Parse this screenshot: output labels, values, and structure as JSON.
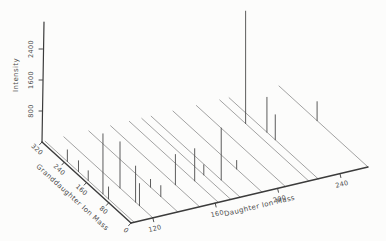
{
  "chart_data": {
    "type": "scatter",
    "variant": "3d oblique stem plot (tandem mass spectrometry map, intensity vs daughter/granddaughter ion mass)",
    "grid": false,
    "legend": false,
    "axes": {
      "intensity": {
        "label": "Intensity",
        "ticks": [
          800,
          1600,
          2400
        ],
        "range": [
          0,
          3100
        ]
      },
      "granddaughter": {
        "label": "Granddaughter Ion Mass",
        "ticks": [
          320,
          240,
          160,
          80,
          0
        ],
        "range": [
          320,
          0
        ]
      },
      "daughter": {
        "label": "Daughter Ion Mass",
        "ticks": [
          120,
          160,
          200,
          240
        ],
        "range": [
          106,
          258
        ]
      }
    },
    "rows": [
      {
        "daughter_mass": 108,
        "peaks": [
          {
            "granddaughter_mass": 240,
            "intensity": 300
          },
          {
            "granddaughter_mass": 200,
            "intensity": 280
          },
          {
            "granddaughter_mass": 165,
            "intensity": 250
          },
          {
            "granddaughter_mass": 112,
            "intensity": 1550
          },
          {
            "granddaughter_mass": 92,
            "intensity": 310
          }
        ]
      },
      {
        "daughter_mass": 120,
        "peaks": [
          {
            "granddaughter_mass": 118,
            "intensity": 1190
          },
          {
            "granddaughter_mass": 62,
            "intensity": 930
          },
          {
            "granddaughter_mass": 48,
            "intensity": 570
          }
        ]
      },
      {
        "daughter_mass": 136,
        "peaks": [
          {
            "granddaughter_mass": 98,
            "intensity": 200
          },
          {
            "granddaughter_mass": 61,
            "intensity": 280
          }
        ]
      },
      {
        "daughter_mass": 150,
        "peaks": [
          {
            "granddaughter_mass": 87,
            "intensity": 780
          }
        ]
      },
      {
        "daughter_mass": 162,
        "peaks": [
          {
            "granddaughter_mass": 85,
            "intensity": 830
          }
        ]
      },
      {
        "daughter_mass": 170,
        "peaks": [
          {
            "granddaughter_mass": 97,
            "intensity": 260
          }
        ]
      },
      {
        "daughter_mass": 176,
        "peaks": [
          {
            "granddaughter_mass": 68,
            "intensity": 1340
          }
        ]
      },
      {
        "daughter_mass": 190,
        "peaks": [
          {
            "granddaughter_mass": 91,
            "intensity": 220
          }
        ]
      },
      {
        "daughter_mass": 205,
        "peaks": []
      },
      {
        "daughter_mass": 220,
        "peaks": [
          {
            "granddaughter_mass": 227,
            "intensity": 2900
          }
        ]
      },
      {
        "daughter_mass": 226,
        "peaks": [
          {
            "granddaughter_mass": 184,
            "intensity": 900
          },
          {
            "granddaughter_mass": 154,
            "intensity": 645
          }
        ]
      },
      {
        "daughter_mass": 258,
        "peaks": [
          {
            "granddaughter_mass": 183,
            "intensity": 490
          }
        ]
      }
    ],
    "colors": {
      "axis": "#3b3b3b",
      "row_line": "#8c8c8c",
      "peak_line": "#4a4a4a",
      "text": "#4a4a4a",
      "background": "#fcfcfb"
    }
  }
}
